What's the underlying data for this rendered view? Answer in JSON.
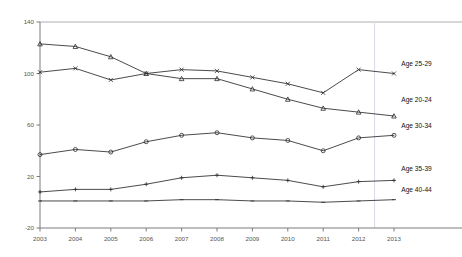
{
  "chart_data": {
    "type": "line",
    "title": "",
    "subtitle": "",
    "xlabel": "",
    "ylabel": "",
    "categories": [
      "2003",
      "2004",
      "2005",
      "2006",
      "2007",
      "2008",
      "2009",
      "2010",
      "2011",
      "2012",
      "2013"
    ],
    "x": [
      2003,
      2004,
      2005,
      2006,
      2007,
      2008,
      2009,
      2010,
      2011,
      2012,
      2013
    ],
    "xlim": [
      2003,
      2013
    ],
    "ylim": [
      -20,
      140
    ],
    "yticks": [
      -20,
      20,
      60,
      100,
      140
    ],
    "ytick_labels": [
      "-20",
      "20",
      "60",
      "100",
      "140"
    ],
    "xtick_labels": [
      "2003",
      "2004",
      "2005",
      "2006",
      "2007",
      "2008",
      "2009",
      "2010",
      "2011",
      "2012",
      "2013"
    ],
    "grid": false,
    "legend_position": "right-inline-labels",
    "line_color": "#2b2b2b",
    "axis_color": "#6e6e6e",
    "guide_line_color": "#d8dde6",
    "series": [
      {
        "name": "Age 25-29",
        "marker": "x",
        "label_x": 2013.15,
        "label_y": 106,
        "values": [
          101,
          104,
          95,
          100,
          103,
          102,
          97,
          92,
          85,
          103,
          100
        ]
      },
      {
        "name": "Age 20-24",
        "marker": "triangle",
        "label_x": 2013.15,
        "label_y": 78,
        "values": [
          123,
          121,
          113,
          100,
          96,
          96,
          88,
          80,
          73,
          70,
          67
        ]
      },
      {
        "name": "Age 30-34",
        "marker": "circle",
        "label_x": 2013.15,
        "label_y": 58,
        "values": [
          37,
          41,
          39,
          47,
          52,
          54,
          50,
          48,
          40,
          50,
          52
        ]
      },
      {
        "name": "Age 35-39",
        "marker": "plus",
        "label_x": 2013.15,
        "label_y": 24,
        "values": [
          8,
          10,
          10,
          14,
          19,
          21,
          19,
          17,
          12,
          16,
          17
        ]
      },
      {
        "name": "Age 40-44",
        "marker": "dash",
        "label_x": 2013.15,
        "label_y": 8,
        "values": [
          1,
          1,
          1,
          1,
          2,
          2,
          1,
          1,
          0,
          1,
          2
        ]
      }
    ],
    "guide_line_x": 2012.45
  }
}
